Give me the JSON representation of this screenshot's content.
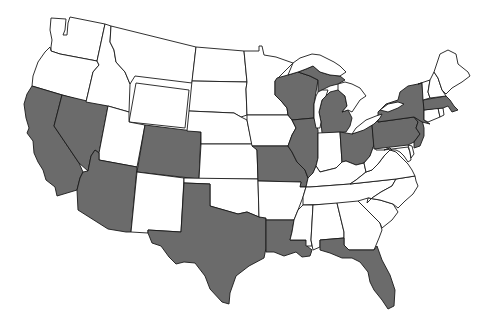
{
  "map": {
    "type": "choropleth",
    "region": "United States (contiguous 48 states)",
    "colors": {
      "shaded": "#6b6b6b",
      "unshaded": "#ffffff",
      "border": "#1a1a1a",
      "background": "#ffffff"
    },
    "shaded_states": [
      "CA",
      "NV",
      "AZ",
      "CO",
      "TX",
      "MO",
      "IL",
      "WI",
      "MI",
      "LA",
      "FL",
      "OH",
      "PA",
      "NY",
      "NJ",
      "MA"
    ],
    "unshaded_states": [
      "WA",
      "OR",
      "ID",
      "MT",
      "WY",
      "UT",
      "NM",
      "ND",
      "SD",
      "NE",
      "KS",
      "OK",
      "MN",
      "IA",
      "AR",
      "MS",
      "AL",
      "GA",
      "SC",
      "NC",
      "TN",
      "KY",
      "IN",
      "WV",
      "VA",
      "MD",
      "DE",
      "CT",
      "RI",
      "VT",
      "NH",
      "ME"
    ],
    "states": [
      {
        "code": "WA",
        "name": "Washington",
        "shaded": false
      },
      {
        "code": "OR",
        "name": "Oregon",
        "shaded": false
      },
      {
        "code": "CA",
        "name": "California",
        "shaded": true
      },
      {
        "code": "NV",
        "name": "Nevada",
        "shaded": true
      },
      {
        "code": "ID",
        "name": "Idaho",
        "shaded": false
      },
      {
        "code": "MT",
        "name": "Montana",
        "shaded": false
      },
      {
        "code": "WY",
        "name": "Wyoming",
        "shaded": false
      },
      {
        "code": "UT",
        "name": "Utah",
        "shaded": false
      },
      {
        "code": "AZ",
        "name": "Arizona",
        "shaded": true
      },
      {
        "code": "CO",
        "name": "Colorado",
        "shaded": true
      },
      {
        "code": "NM",
        "name": "New Mexico",
        "shaded": false
      },
      {
        "code": "ND",
        "name": "North Dakota",
        "shaded": false
      },
      {
        "code": "SD",
        "name": "South Dakota",
        "shaded": false
      },
      {
        "code": "NE",
        "name": "Nebraska",
        "shaded": false
      },
      {
        "code": "KS",
        "name": "Kansas",
        "shaded": false
      },
      {
        "code": "OK",
        "name": "Oklahoma",
        "shaded": false
      },
      {
        "code": "TX",
        "name": "Texas",
        "shaded": true
      },
      {
        "code": "MN",
        "name": "Minnesota",
        "shaded": false
      },
      {
        "code": "IA",
        "name": "Iowa",
        "shaded": false
      },
      {
        "code": "MO",
        "name": "Missouri",
        "shaded": true
      },
      {
        "code": "AR",
        "name": "Arkansas",
        "shaded": false
      },
      {
        "code": "LA",
        "name": "Louisiana",
        "shaded": true
      },
      {
        "code": "WI",
        "name": "Wisconsin",
        "shaded": true
      },
      {
        "code": "IL",
        "name": "Illinois",
        "shaded": true
      },
      {
        "code": "MI",
        "name": "Michigan",
        "shaded": true
      },
      {
        "code": "IN",
        "name": "Indiana",
        "shaded": false
      },
      {
        "code": "OH",
        "name": "Ohio",
        "shaded": true
      },
      {
        "code": "KY",
        "name": "Kentucky",
        "shaded": false
      },
      {
        "code": "TN",
        "name": "Tennessee",
        "shaded": false
      },
      {
        "code": "MS",
        "name": "Mississippi",
        "shaded": false
      },
      {
        "code": "AL",
        "name": "Alabama",
        "shaded": false
      },
      {
        "code": "GA",
        "name": "Georgia",
        "shaded": false
      },
      {
        "code": "FL",
        "name": "Florida",
        "shaded": true
      },
      {
        "code": "SC",
        "name": "South Carolina",
        "shaded": false
      },
      {
        "code": "NC",
        "name": "North Carolina",
        "shaded": false
      },
      {
        "code": "VA",
        "name": "Virginia",
        "shaded": false
      },
      {
        "code": "WV",
        "name": "West Virginia",
        "shaded": false
      },
      {
        "code": "MD",
        "name": "Maryland",
        "shaded": false
      },
      {
        "code": "DE",
        "name": "Delaware",
        "shaded": false
      },
      {
        "code": "PA",
        "name": "Pennsylvania",
        "shaded": true
      },
      {
        "code": "NJ",
        "name": "New Jersey",
        "shaded": true
      },
      {
        "code": "NY",
        "name": "New York",
        "shaded": true
      },
      {
        "code": "CT",
        "name": "Connecticut",
        "shaded": false
      },
      {
        "code": "RI",
        "name": "Rhode Island",
        "shaded": false
      },
      {
        "code": "MA",
        "name": "Massachusetts",
        "shaded": true
      },
      {
        "code": "VT",
        "name": "Vermont",
        "shaded": false
      },
      {
        "code": "NH",
        "name": "New Hampshire",
        "shaded": false
      },
      {
        "code": "ME",
        "name": "Maine",
        "shaded": false
      }
    ],
    "shaded_count": 16,
    "unshaded_count": 32
  }
}
